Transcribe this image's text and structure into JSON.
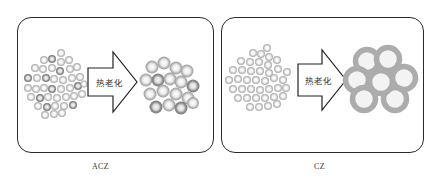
{
  "figure": {
    "panels": [
      {
        "id": "acz",
        "caption": "ACZ",
        "arrow_label": "热老化",
        "before": "small-particles-cluster",
        "after": "slightly-grown-particles-cluster"
      },
      {
        "id": "cz",
        "caption": "CZ",
        "arrow_label": "热老化",
        "before": "small-particles-cluster",
        "after": "large-ring-particles-cluster"
      }
    ],
    "colors": {
      "frame": "#2a2a2a",
      "particle_light": "#c8c8c8",
      "particle_dark": "#8c8c8c",
      "ring_large": "#b0b0b0",
      "ring_inner": "#f2f2f2"
    }
  }
}
